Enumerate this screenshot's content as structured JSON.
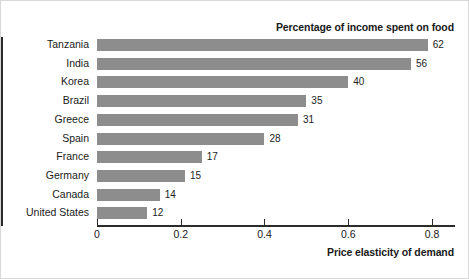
{
  "chart_data": {
    "type": "bar",
    "orientation": "horizontal",
    "title": "Percentage of income spent on food",
    "xlabel": "Price elasticity of demand",
    "ylabel": "",
    "xlim": [
      0,
      0.855
    ],
    "xticks": [
      "0",
      "0.2",
      "0.4",
      "0.6",
      "0.8"
    ],
    "xtick_values": [
      0,
      0.2,
      0.4,
      0.6,
      0.8
    ],
    "grid": false,
    "legend": "none",
    "bar_color": "#8d8d8d",
    "axis_color": "#2b2b2b",
    "categories": [
      "Tanzania",
      "India",
      "Korea",
      "Brazil",
      "Greece",
      "Spain",
      "France",
      "Germany",
      "Canada",
      "United States"
    ],
    "values": [
      0.79,
      0.75,
      0.6,
      0.5,
      0.48,
      0.4,
      0.25,
      0.21,
      0.15,
      0.12
    ],
    "point_labels": [
      "62",
      "56",
      "40",
      "35",
      "31",
      "28",
      "17",
      "15",
      "14",
      "12"
    ],
    "point_label_meaning": "Percentage of income spent on food"
  }
}
